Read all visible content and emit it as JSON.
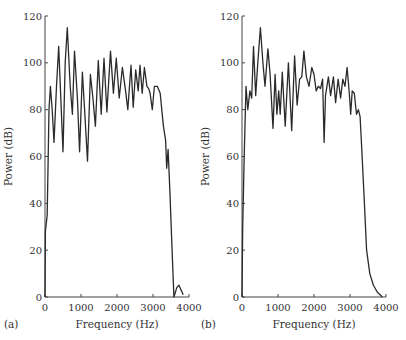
{
  "chart_data": [
    {
      "type": "line",
      "panel_label": "(a)",
      "title": "",
      "xlabel": "Frequency (Hz)",
      "ylabel": "Power (dB)",
      "xlim": [
        0,
        4000
      ],
      "ylim": [
        0,
        120
      ],
      "xticks": [
        0,
        1000,
        2000,
        3000,
        4000
      ],
      "yticks": [
        0,
        20,
        40,
        60,
        80,
        100,
        120
      ],
      "grid": false,
      "legend": null,
      "series": [
        {
          "name": "spectrum-a",
          "x": [
            0,
            10,
            60,
            110,
            150,
            200,
            250,
            320,
            380,
            440,
            500,
            560,
            620,
            700,
            760,
            820,
            900,
            960,
            1040,
            1100,
            1180,
            1260,
            1330,
            1400,
            1480,
            1560,
            1640,
            1720,
            1820,
            1900,
            1980,
            2060,
            2150,
            2230,
            2300,
            2390,
            2450,
            2520,
            2590,
            2640,
            2700,
            2760,
            2830,
            2880,
            2920,
            2980,
            3040,
            3120,
            3200,
            3290,
            3350,
            3380,
            3420,
            3470,
            3530,
            3580,
            3660,
            3720,
            3780,
            3840
          ],
          "y": [
            0,
            28,
            35,
            80,
            90,
            80,
            66,
            90,
            107,
            85,
            62,
            100,
            115,
            90,
            78,
            105,
            85,
            62,
            96,
            80,
            58,
            95,
            85,
            73,
            101,
            78,
            102,
            79,
            105,
            87,
            102,
            85,
            98,
            89,
            80,
            99,
            81,
            97,
            88,
            99,
            87,
            98,
            90,
            89,
            87,
            80,
            90,
            90,
            87,
            73,
            67,
            55,
            63,
            45,
            20,
            0,
            4,
            5,
            3,
            1
          ]
        }
      ]
    },
    {
      "type": "line",
      "panel_label": "(b)",
      "title": "",
      "xlabel": "Frequency (Hz)",
      "ylabel": "Power (dB)",
      "xlim": [
        0,
        4000
      ],
      "ylim": [
        0,
        120
      ],
      "xticks": [
        0,
        1000,
        2000,
        3000,
        4000
      ],
      "yticks": [
        0,
        20,
        40,
        60,
        80,
        100,
        120
      ],
      "grid": false,
      "legend": null,
      "series": [
        {
          "name": "spectrum-b",
          "x": [
            0,
            20,
            60,
            110,
            160,
            220,
            270,
            320,
            380,
            440,
            510,
            580,
            640,
            720,
            780,
            860,
            920,
            970,
            1020,
            1060,
            1120,
            1200,
            1290,
            1380,
            1460,
            1530,
            1600,
            1660,
            1720,
            1790,
            1860,
            1940,
            2000,
            2060,
            2120,
            2180,
            2240,
            2280,
            2320,
            2400,
            2460,
            2540,
            2600,
            2670,
            2740,
            2800,
            2860,
            2920,
            2980,
            3020,
            3060,
            3120,
            3180,
            3230,
            3280,
            3330,
            3400,
            3460,
            3550,
            3650,
            3760,
            3900
          ],
          "y": [
            0,
            30,
            60,
            90,
            80,
            88,
            85,
            107,
            86,
            100,
            115,
            100,
            90,
            106,
            95,
            72,
            95,
            78,
            88,
            78,
            96,
            73,
            100,
            71,
            103,
            82,
            93,
            94,
            105,
            94,
            90,
            98,
            95,
            88,
            90,
            89,
            93,
            66,
            86,
            94,
            86,
            94,
            83,
            93,
            85,
            93,
            90,
            98,
            87,
            78,
            88,
            87,
            78,
            80,
            77,
            62,
            40,
            20,
            10,
            5,
            2,
            0
          ]
        }
      ]
    }
  ],
  "panels": [
    {
      "label": "(a)",
      "xlabel": "Frequency (Hz)",
      "ylabel": "Power (dB)",
      "xtick_labels": [
        "0",
        "1000",
        "2000",
        "3000",
        "4000"
      ],
      "ytick_labels": [
        "0",
        "20",
        "40",
        "60",
        "80",
        "100",
        "120"
      ]
    },
    {
      "label": "(b)",
      "xlabel": "Frequency (Hz)",
      "ylabel": "Power (dB)",
      "xtick_labels": [
        "0",
        "1000",
        "2000",
        "3000",
        "4000"
      ],
      "ytick_labels": [
        "0",
        "20",
        "40",
        "60",
        "80",
        "100",
        "120"
      ]
    }
  ],
  "colors": {
    "line": "#2a2a2a",
    "axis": "#444444",
    "text": "#333333"
  }
}
